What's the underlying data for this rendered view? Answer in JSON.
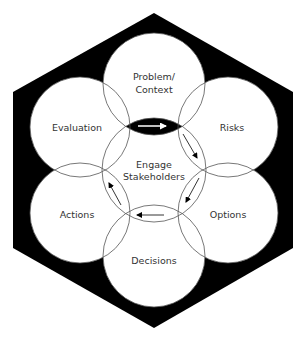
{
  "diagram": {
    "center": {
      "label_line1": "Engage",
      "label_line2": "Stakeholders"
    },
    "nodes": [
      {
        "id": "problem",
        "label_line1": "Problem/",
        "label_line2": "Context"
      },
      {
        "id": "risks",
        "label": "Risks"
      },
      {
        "id": "options",
        "label": "Options"
      },
      {
        "id": "decisions",
        "label": "Decisions"
      },
      {
        "id": "actions",
        "label": "Actions"
      },
      {
        "id": "evaluation",
        "label": "Evaluation"
      }
    ],
    "flow": [
      "Problem/Context",
      "Risks",
      "Options",
      "Decisions",
      "Actions",
      "Evaluation"
    ],
    "colors": {
      "background_hexagon": "#000000",
      "circle_fill": "#ffffff",
      "circle_stroke": "#555555",
      "text": "#333333"
    }
  }
}
